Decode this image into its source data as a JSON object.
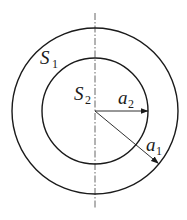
{
  "figure": {
    "type": "concentric-circles",
    "center": {
      "x": 95,
      "y": 111
    },
    "outer_circle": {
      "label": "S",
      "subscript": "1",
      "radius_label": "a",
      "radius_subscript": "1"
    },
    "inner_circle": {
      "label": "S",
      "subscript": "2",
      "radius_label": "a",
      "radius_subscript": "2"
    },
    "axis": {
      "style": "dash-dot",
      "orientation": "vertical"
    }
  },
  "labels": {
    "s1": {
      "main": "S",
      "sub": "1"
    },
    "s2": {
      "main": "S",
      "sub": "2"
    },
    "a1": {
      "main": "a",
      "sub": "1"
    },
    "a2": {
      "main": "a",
      "sub": "2"
    }
  },
  "colors": {
    "stroke": "#1a1a1a",
    "background": "#ffffff"
  }
}
